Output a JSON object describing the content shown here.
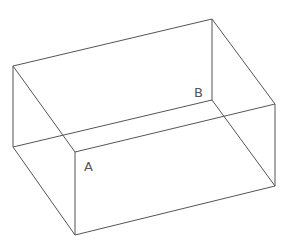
{
  "diagram": {
    "type": "wireframe-box",
    "stroke_color": "#555555",
    "background": "#ffffff",
    "vertices": {
      "top_back_left": [
        13,
        66
      ],
      "top_back_right": [
        212,
        19
      ],
      "top_front_right": [
        275,
        104
      ],
      "top_front_left": [
        75,
        152
      ],
      "bottom_back_left": [
        13,
        147
      ],
      "bottom_front_left": [
        75,
        235
      ],
      "bottom_front_right": [
        275,
        186
      ],
      "inner_corner": [
        212,
        100
      ]
    },
    "labels": [
      {
        "id": "A",
        "text": "A",
        "x": 84,
        "y": 171
      },
      {
        "id": "B",
        "text": "B",
        "x": 194,
        "y": 97
      }
    ]
  }
}
